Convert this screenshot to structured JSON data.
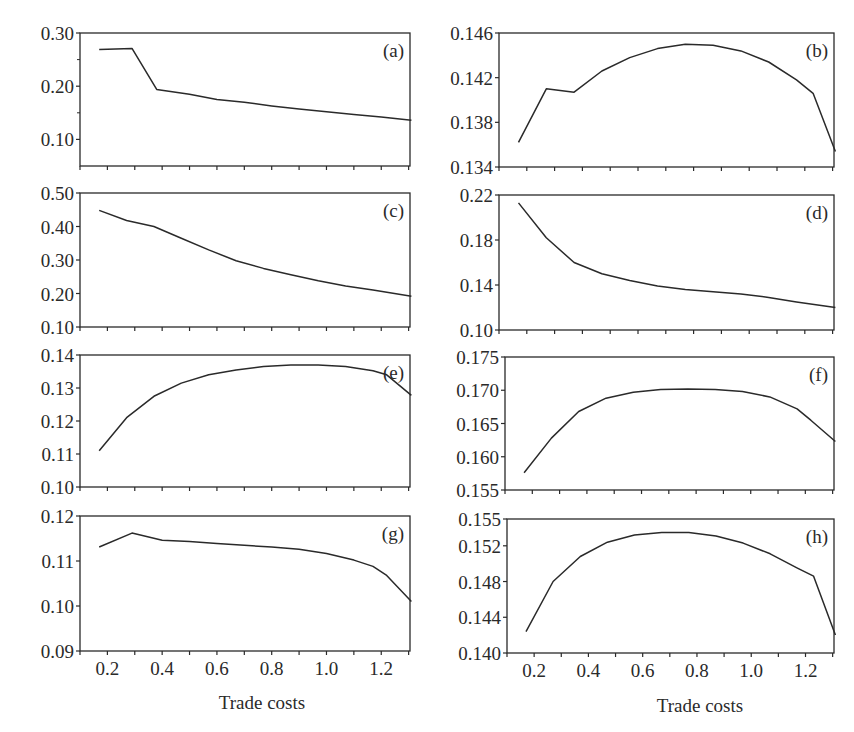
{
  "figure": {
    "xlabel": "Trade costs",
    "x_tick_labels": [
      "0.2",
      "0.4",
      "0.6",
      "0.8",
      "1.0",
      "1.2"
    ],
    "line_color": "#2a2a2a"
  },
  "chart_data": [
    {
      "type": "line",
      "panel": "(a)",
      "xlabel": "",
      "ylabel": "",
      "xlim": [
        0.1,
        1.4
      ],
      "ylim": [
        0.05,
        0.3
      ],
      "yticks": [
        0.1,
        0.2,
        0.3
      ],
      "ytick_labels": [
        "0.10",
        "0.20",
        "0.30"
      ],
      "x": [
        0.17,
        0.29,
        0.38,
        0.5,
        0.6,
        0.7,
        0.8,
        0.9,
        1.0,
        1.1,
        1.2,
        1.31
      ],
      "y": [
        0.269,
        0.271,
        0.194,
        0.185,
        0.175,
        0.17,
        0.163,
        0.157,
        0.152,
        0.147,
        0.142,
        0.136
      ]
    },
    {
      "type": "line",
      "panel": "(b)",
      "xlabel": "",
      "ylabel": "",
      "xlim": [
        0.1,
        1.4
      ],
      "ylim": [
        0.134,
        0.146
      ],
      "yticks": [
        0.134,
        0.138,
        0.142,
        0.146
      ],
      "ytick_labels": [
        "0.134",
        "0.138",
        "0.142",
        "0.146"
      ],
      "x": [
        0.17,
        0.27,
        0.37,
        0.47,
        0.57,
        0.67,
        0.77,
        0.87,
        0.97,
        1.07,
        1.17,
        1.23,
        1.31
      ],
      "y": [
        0.1362,
        0.141,
        0.1407,
        0.1426,
        0.1438,
        0.1446,
        0.145,
        0.1449,
        0.1444,
        0.1434,
        0.1418,
        0.1406,
        0.1354
      ]
    },
    {
      "type": "line",
      "panel": "(c)",
      "xlabel": "",
      "ylabel": "",
      "xlim": [
        0.1,
        1.4
      ],
      "ylim": [
        0.1,
        0.5
      ],
      "yticks": [
        0.1,
        0.2,
        0.3,
        0.4,
        0.5
      ],
      "ytick_labels": [
        "0.10",
        "0.20",
        "0.30",
        "0.40",
        "0.50"
      ],
      "x": [
        0.17,
        0.27,
        0.37,
        0.47,
        0.57,
        0.67,
        0.77,
        0.87,
        0.97,
        1.07,
        1.17,
        1.31
      ],
      "y": [
        0.448,
        0.418,
        0.4,
        0.365,
        0.33,
        0.298,
        0.275,
        0.256,
        0.238,
        0.222,
        0.21,
        0.192
      ]
    },
    {
      "type": "line",
      "panel": "(d)",
      "xlabel": "",
      "ylabel": "",
      "xlim": [
        0.1,
        1.4
      ],
      "ylim": [
        0.1,
        0.22
      ],
      "yticks": [
        0.1,
        0.14,
        0.18,
        0.22
      ],
      "ytick_labels": [
        "0.10",
        "0.14",
        "0.18",
        "0.22"
      ],
      "x": [
        0.17,
        0.27,
        0.37,
        0.47,
        0.57,
        0.67,
        0.77,
        0.87,
        0.97,
        1.07,
        1.17,
        1.31
      ],
      "y": [
        0.213,
        0.182,
        0.16,
        0.15,
        0.144,
        0.139,
        0.136,
        0.134,
        0.132,
        0.129,
        0.125,
        0.12
      ]
    },
    {
      "type": "line",
      "panel": "(e)",
      "xlabel": "",
      "ylabel": "",
      "xlim": [
        0.1,
        1.4
      ],
      "ylim": [
        0.1,
        0.14
      ],
      "yticks": [
        0.1,
        0.11,
        0.12,
        0.13,
        0.14
      ],
      "ytick_labels": [
        "0.10",
        "0.11",
        "0.12",
        "0.13",
        "0.14"
      ],
      "x": [
        0.17,
        0.27,
        0.37,
        0.47,
        0.57,
        0.67,
        0.77,
        0.87,
        0.97,
        1.07,
        1.17,
        1.22,
        1.31
      ],
      "y": [
        0.111,
        0.121,
        0.1275,
        0.1315,
        0.134,
        0.1355,
        0.1365,
        0.137,
        0.137,
        0.1365,
        0.1352,
        0.134,
        0.1278
      ]
    },
    {
      "type": "line",
      "panel": "(f)",
      "xlabel": "",
      "ylabel": "",
      "xlim": [
        0.1,
        1.4
      ],
      "ylim": [
        0.155,
        0.175
      ],
      "yticks": [
        0.155,
        0.16,
        0.165,
        0.17,
        0.175
      ],
      "ytick_labels": [
        "0.155",
        "0.160",
        "0.165",
        "0.170",
        "0.175"
      ],
      "x": [
        0.17,
        0.27,
        0.37,
        0.47,
        0.57,
        0.67,
        0.77,
        0.87,
        0.97,
        1.07,
        1.17,
        1.22,
        1.31
      ],
      "y": [
        0.1576,
        0.1628,
        0.1668,
        0.1688,
        0.1697,
        0.1701,
        0.1702,
        0.1701,
        0.1698,
        0.169,
        0.1672,
        0.1655,
        0.1623
      ]
    },
    {
      "type": "line",
      "panel": "(g)",
      "xlabel": "Trade costs",
      "ylabel": "",
      "xlim": [
        0.1,
        1.4
      ],
      "ylim": [
        0.09,
        0.12
      ],
      "yticks": [
        0.09,
        0.1,
        0.11,
        0.12
      ],
      "ytick_labels": [
        "0.09",
        "0.10",
        "0.11",
        "0.12"
      ],
      "x": [
        0.17,
        0.29,
        0.4,
        0.5,
        0.6,
        0.7,
        0.8,
        0.9,
        1.0,
        1.1,
        1.17,
        1.22,
        1.31
      ],
      "y": [
        0.1131,
        0.1162,
        0.1146,
        0.1143,
        0.1139,
        0.1135,
        0.1131,
        0.1126,
        0.1117,
        0.1102,
        0.1088,
        0.1068,
        0.101
      ]
    },
    {
      "type": "line",
      "panel": "(h)",
      "xlabel": "Trade costs",
      "ylabel": "",
      "xlim": [
        0.1,
        1.4
      ],
      "ylim": [
        0.14,
        0.155
      ],
      "yticks": [
        0.14,
        0.144,
        0.148,
        0.152,
        0.155
      ],
      "ytick_labels": [
        "0.140",
        "0.144",
        "0.148",
        "0.152",
        "0.155"
      ],
      "x": [
        0.17,
        0.27,
        0.37,
        0.47,
        0.57,
        0.67,
        0.77,
        0.87,
        0.97,
        1.07,
        1.17,
        1.23,
        1.31
      ],
      "y": [
        0.1424,
        0.148,
        0.1508,
        0.1524,
        0.1532,
        0.1535,
        0.1535,
        0.1531,
        0.1523,
        0.1511,
        0.1495,
        0.1486,
        0.142
      ]
    }
  ]
}
